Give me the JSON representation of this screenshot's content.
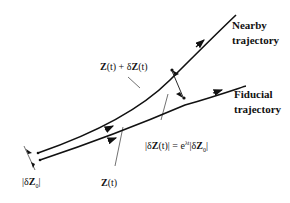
{
  "diagram": {
    "labels": {
      "nearby_line1": "Nearby",
      "nearby_line2": "trajectory",
      "fiducial_line1": "Fiducial",
      "fiducial_line2": "trajectory",
      "perturbed": "Z(t) + δZ(t)",
      "unperturbed": "Z(t)",
      "initial_sep": "|δZ₀|",
      "growth_law": "|δZ(t)| = e^{λt}|δZ₀|"
    },
    "colors": {
      "line": "#111111",
      "background": "#ffffff"
    }
  }
}
